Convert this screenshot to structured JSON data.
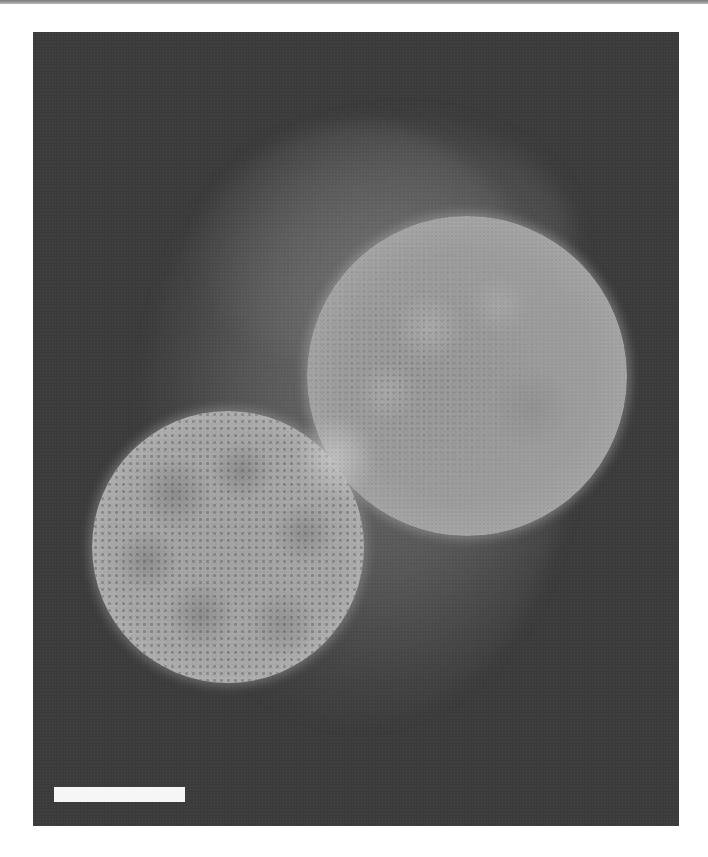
{
  "figure": {
    "type": "fluorescence-micrograph",
    "colormap": "grayscale",
    "background_color": "#3c3c3c",
    "page_background": "#ffffff",
    "objects": [
      {
        "name": "large-sphere",
        "center_px": [
          467,
          376
        ],
        "radius_px": 160,
        "texture": "faint mottled, dotted lattice near left edge"
      },
      {
        "name": "small-sphere",
        "center_px": [
          228,
          547
        ],
        "radius_px": 136,
        "texture": "dotted lattice with dark branching patches"
      }
    ],
    "scale_bar": {
      "color": "#f6f6f6",
      "length_px": 131,
      "label": ""
    }
  }
}
